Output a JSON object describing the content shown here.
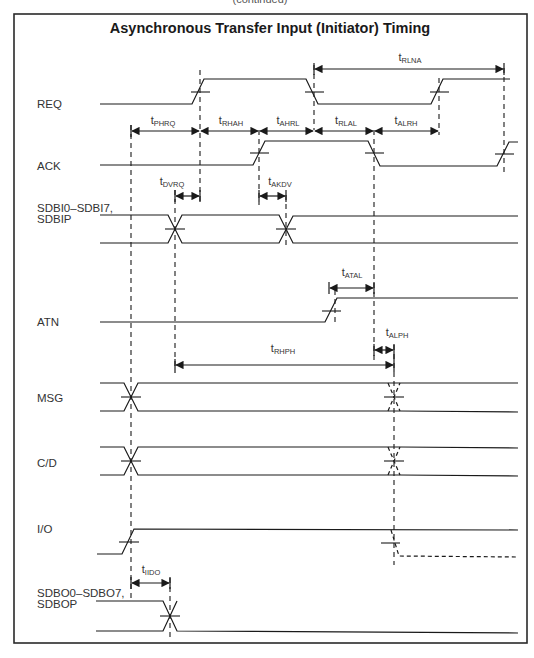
{
  "header": {
    "top_cut_text": "(continued)",
    "title": "Asynchronous Transfer Input (Initiator) Timing"
  },
  "signals": [
    {
      "id": "req",
      "label": "REQ"
    },
    {
      "id": "ack",
      "label": "ACK"
    },
    {
      "id": "sdbi",
      "label": "SDBI0–SDBI7,",
      "label2": "SDBIP"
    },
    {
      "id": "atn",
      "label": "ATN"
    },
    {
      "id": "msg",
      "label": "MSG"
    },
    {
      "id": "cd",
      "label": "C/D"
    },
    {
      "id": "io",
      "label": "I/O"
    },
    {
      "id": "sdbo",
      "label": "SDBO0–SDBO7,",
      "label2": "SDBOP"
    }
  ],
  "timing_params": [
    {
      "id": "rlna",
      "t": "t",
      "sub": "RLNA"
    },
    {
      "id": "phrq",
      "t": "t",
      "sub": "PHRQ"
    },
    {
      "id": "rhah",
      "t": "t",
      "sub": "RHAH"
    },
    {
      "id": "ahrl",
      "t": "t",
      "sub": "AHRL"
    },
    {
      "id": "rlal",
      "t": "t",
      "sub": "RLAL"
    },
    {
      "id": "alrh",
      "t": "t",
      "sub": "ALRH"
    },
    {
      "id": "dvrq",
      "t": "t",
      "sub": "DVRQ"
    },
    {
      "id": "akdv",
      "t": "t",
      "sub": "AKDV"
    },
    {
      "id": "atal",
      "t": "t",
      "sub": "ATAL"
    },
    {
      "id": "alph",
      "t": "t",
      "sub": "ALPH"
    },
    {
      "id": "rhph",
      "t": "t",
      "sub": "RHPH"
    },
    {
      "id": "iido",
      "t": "t",
      "sub": "IIDO"
    }
  ],
  "colors": {
    "line": "#1a1a1a",
    "background": "#ffffff"
  }
}
